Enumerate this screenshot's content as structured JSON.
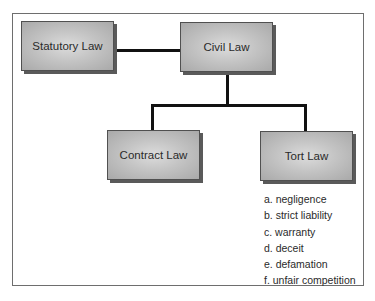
{
  "diagram": {
    "type": "hierarchy",
    "nodes": [
      {
        "id": "statutory",
        "label": "Statutory Law"
      },
      {
        "id": "civil",
        "label": "Civil Law"
      },
      {
        "id": "contract",
        "label": "Contract Law"
      },
      {
        "id": "tort",
        "label": "Tort Law"
      }
    ],
    "edges": [
      {
        "from": "statutory",
        "to": "civil"
      },
      {
        "from": "civil",
        "to": "contract"
      },
      {
        "from": "civil",
        "to": "tort"
      }
    ],
    "tort_list": [
      "a. negligence",
      "b. strict liability",
      "c. warranty",
      "d. deceit",
      "e. defamation",
      "f. unfair competition"
    ]
  }
}
